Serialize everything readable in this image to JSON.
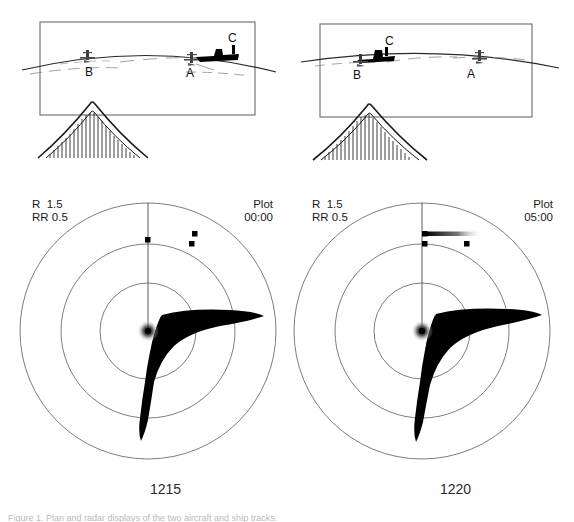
{
  "figure": {
    "caption": "Figure 1.  Plan and radar displays of the two aircraft and ship tracks.",
    "panels": [
      {
        "id": "left",
        "time_label": "1215",
        "scene": {
          "objects": [
            {
              "label": "B",
              "type": "aircraft",
              "x": 88,
              "y": 56
            },
            {
              "label": "A",
              "type": "aircraft",
              "x": 192,
              "y": 62
            },
            {
              "label": "C",
              "type": "ship",
              "x": 228,
              "y": 44
            }
          ],
          "terrain_label": "ridge-profile"
        },
        "radar": {
          "range_label": "R",
          "range_value": "1.5",
          "range_rate_label": "RR",
          "range_rate_value": "0.5",
          "plot_label": "Plot",
          "plot_time": "00:00",
          "rings": [
            48,
            87,
            128
          ],
          "sweep_bearing_deg": 0,
          "blips": [
            {
              "x": 0,
              "y": -90,
              "size": 5,
              "trail": 0
            },
            {
              "x": 46,
              "y": -96,
              "size": 5,
              "trail": 0
            },
            {
              "x": 43,
              "y": -86,
              "size": 5,
              "trail": 0
            }
          ],
          "clutter_label": "land-return-lobe"
        }
      },
      {
        "id": "right",
        "time_label": "1220",
        "scene": {
          "objects": [
            {
              "label": "C",
              "type": "ship",
              "x": 80,
              "y": 40
            },
            {
              "label": "B",
              "type": "aircraft",
              "x": 68,
              "y": 58
            },
            {
              "label": "A",
              "type": "aircraft",
              "x": 188,
              "y": 62
            }
          ],
          "terrain_label": "ridge-profile"
        },
        "radar": {
          "range_label": "R",
          "range_value": "1.5",
          "range_rate_label": "RR",
          "range_rate_value": "0.5",
          "plot_label": "Plot",
          "plot_time": "05:00",
          "rings": [
            48,
            87,
            128
          ],
          "sweep_bearing_deg": 0,
          "blips": [
            {
              "x": 5,
              "y": -96,
              "size": 5,
              "trail": 56
            },
            {
              "x": 5,
              "y": -86,
              "size": 5,
              "trail": 0
            },
            {
              "x": 45,
              "y": -86,
              "size": 5,
              "trail": 0
            }
          ],
          "clutter_label": "land-return-lobe"
        }
      }
    ]
  },
  "colors": {
    "ink": "#1a1a1a",
    "line": "#5a5a5a",
    "ring": "#6e6e6e",
    "blip": "#000000",
    "caption": "#bdbdbd"
  }
}
